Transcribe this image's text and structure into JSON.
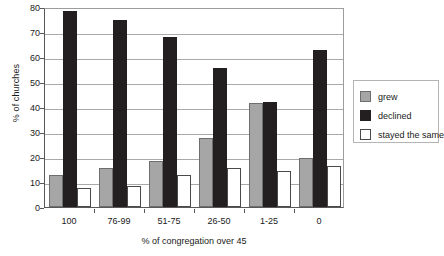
{
  "chart_data": {
    "type": "bar",
    "title": "",
    "xlabel": "% of congregation over 45",
    "ylabel": "% of churches",
    "categories": [
      "100",
      "76-99",
      "51-75",
      "26-50",
      "1-25",
      "0"
    ],
    "series": [
      {
        "name": "grew",
        "color": "#a6a6a6",
        "values": [
          13,
          15.5,
          18.5,
          27.5,
          41.5,
          19.5
        ]
      },
      {
        "name": "declined",
        "color": "#231f20",
        "values": [
          78.5,
          75,
          68,
          55.5,
          42,
          63
        ]
      },
      {
        "name": "stayed the same",
        "color": "#ffffff",
        "values": [
          7.5,
          8.5,
          13,
          15.5,
          14.5,
          16.5
        ]
      }
    ],
    "ylim": [
      0,
      80
    ],
    "yticks": [
      0,
      10,
      20,
      30,
      40,
      50,
      60,
      70,
      80
    ],
    "ytick_labels": [
      "0",
      "10",
      "20",
      "30",
      "40",
      "50",
      "60",
      "70",
      "80"
    ],
    "grid": true,
    "legend_position": "right",
    "legend_entries": [
      "grew",
      "declined",
      "stayed the same"
    ]
  }
}
